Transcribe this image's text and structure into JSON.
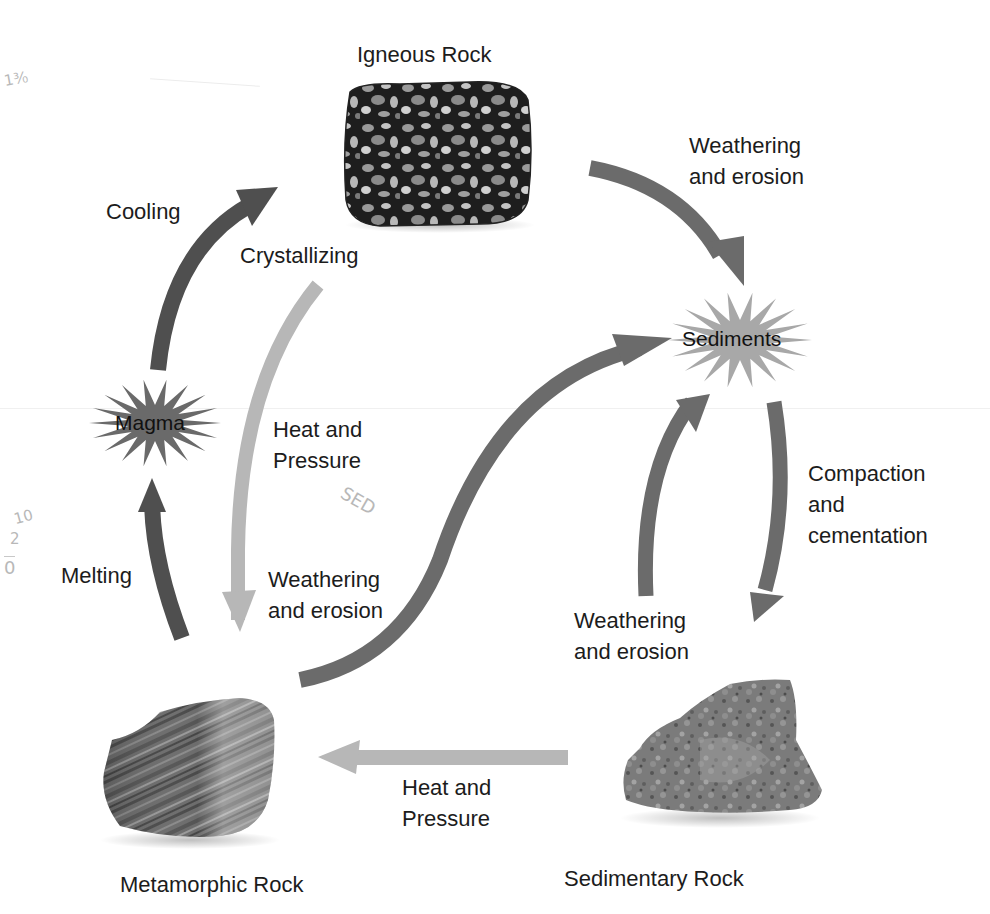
{
  "diagram": {
    "colors": {
      "dark_arrow": "#4d4d4d",
      "mid_arrow": "#6e6e6e",
      "light_arrow": "#b5b5b5",
      "burst_dark": "#6a6a6a",
      "burst_light": "#a8a8a8",
      "text": "#1c1c1c",
      "background": "#ffffff"
    },
    "nodes": {
      "igneous": {
        "label": "Igneous Rock",
        "type": "rock-photo"
      },
      "sedimentary": {
        "label": "Sedimentary Rock",
        "type": "rock-photo"
      },
      "metamorphic": {
        "label": "Metamorphic Rock",
        "type": "rock-photo"
      },
      "sediments": {
        "label": "Sediments",
        "type": "starburst"
      },
      "magma": {
        "label": "Magma",
        "type": "starburst"
      }
    },
    "processes": {
      "igneous_to_sediments": {
        "line1": "Weathering",
        "line2": "and erosion"
      },
      "magma_to_igneous_a": {
        "line1": "Cooling"
      },
      "magma_to_igneous_b": {
        "line1": "Crystallizing"
      },
      "igneous_to_metamorphic": {
        "line1": "Heat and",
        "line2": "Pressure"
      },
      "metamorphic_to_sediments": {
        "line1": "Weathering",
        "line2": "and erosion"
      },
      "metamorphic_to_magma": {
        "line1": "Melting"
      },
      "sediments_to_sedimentary": {
        "line1": "Compaction",
        "line2": "and",
        "line3": "cementation"
      },
      "sedimentary_to_sediments": {
        "line1": "Weathering",
        "line2": "and erosion"
      },
      "sedimentary_to_metamorphic": {
        "line1": "Heat and",
        "line2": "Pressure"
      }
    },
    "edges": [
      {
        "from": "Igneous Rock",
        "to": "Sediments",
        "process": "Weathering and erosion"
      },
      {
        "from": "Sediments",
        "to": "Sedimentary Rock",
        "process": "Compaction and cementation"
      },
      {
        "from": "Sedimentary Rock",
        "to": "Sediments",
        "process": "Weathering and erosion"
      },
      {
        "from": "Sedimentary Rock",
        "to": "Metamorphic Rock",
        "process": "Heat and Pressure"
      },
      {
        "from": "Metamorphic Rock",
        "to": "Sediments",
        "process": "Weathering and erosion"
      },
      {
        "from": "Metamorphic Rock",
        "to": "Magma",
        "process": "Melting"
      },
      {
        "from": "Magma",
        "to": "Igneous Rock",
        "process": "Cooling / Crystallizing"
      },
      {
        "from": "Igneous Rock",
        "to": "Metamorphic Rock",
        "process": "Heat and Pressure"
      }
    ],
    "handwritten_notes": {
      "top_left": "1³⁄₀",
      "center": "SED",
      "left_margin_top": "10",
      "left_margin_mid": "2",
      "left_margin_bottom": "0"
    }
  }
}
